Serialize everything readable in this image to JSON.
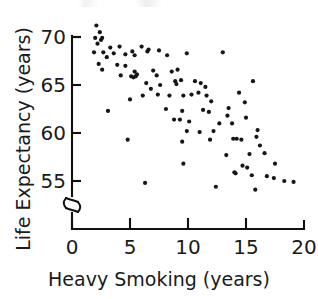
{
  "figure": {
    "background_color": "#ffffff",
    "ink_color": "#161616"
  },
  "axes": {
    "x_title": "Heavy Smoking (years)",
    "y_title": "Life Expectancy (years)",
    "x_ticks": [
      "0",
      "5",
      "10",
      "15",
      "20"
    ],
    "y_ticks": [
      "55",
      "60",
      "65",
      "70"
    ],
    "y_axis_break": "broken-axis-squiggle"
  },
  "chart_data": {
    "type": "scatter",
    "title": "",
    "xlabel": "Heavy Smoking (years)",
    "ylabel": "Life Expectancy (years)",
    "xlim": [
      0,
      20
    ],
    "ylim": [
      53.5,
      71.5
    ],
    "xticks": [
      0,
      5,
      10,
      15,
      20
    ],
    "yticks": [
      55,
      60,
      65,
      70
    ],
    "grid": false,
    "legend": null,
    "y_axis_broken": true,
    "marker": "filled-circle",
    "n_points": 97,
    "points": [
      [
        2.1,
        71.2
      ],
      [
        2.4,
        70.5
      ],
      [
        2.0,
        69.9
      ],
      [
        2.5,
        69.7
      ],
      [
        2.6,
        69.9
      ],
      [
        2.2,
        69.3
      ],
      [
        1.9,
        68.4
      ],
      [
        2.7,
        68.4
      ],
      [
        3.3,
        68.9
      ],
      [
        4.1,
        69.0
      ],
      [
        3.0,
        67.9
      ],
      [
        3.6,
        68.3
      ],
      [
        2.3,
        67.2
      ],
      [
        2.6,
        66.6
      ],
      [
        4.6,
        68.2
      ],
      [
        5.2,
        68.5
      ],
      [
        5.4,
        68.1
      ],
      [
        6.0,
        69.0
      ],
      [
        6.5,
        68.5
      ],
      [
        6.6,
        68.7
      ],
      [
        7.5,
        68.6
      ],
      [
        8.2,
        68.1
      ],
      [
        9.9,
        68.3
      ],
      [
        13.0,
        68.4
      ],
      [
        3.9,
        67.1
      ],
      [
        4.6,
        67.0
      ],
      [
        4.2,
        66.0
      ],
      [
        5.1,
        65.9
      ],
      [
        5.3,
        65.8
      ],
      [
        5.5,
        65.9
      ],
      [
        5.6,
        66.1
      ],
      [
        5.4,
        66.4
      ],
      [
        7.0,
        66.5
      ],
      [
        7.3,
        66.0
      ],
      [
        8.6,
        66.4
      ],
      [
        9.1,
        66.6
      ],
      [
        8.9,
        65.4
      ],
      [
        9.4,
        65.5
      ],
      [
        9.0,
        65.1
      ],
      [
        6.4,
        65.2
      ],
      [
        6.8,
        64.6
      ],
      [
        7.6,
        65.0
      ],
      [
        10.6,
        65.4
      ],
      [
        11.1,
        65.2
      ],
      [
        11.5,
        64.8
      ],
      [
        15.6,
        65.4
      ],
      [
        5.0,
        63.5
      ],
      [
        6.1,
        63.9
      ],
      [
        7.4,
        64.0
      ],
      [
        8.4,
        63.9
      ],
      [
        9.6,
        63.9
      ],
      [
        10.3,
        64.0
      ],
      [
        10.9,
        64.2
      ],
      [
        11.6,
        63.9
      ],
      [
        12.0,
        63.3
      ],
      [
        14.4,
        64.2
      ],
      [
        14.9,
        63.2
      ],
      [
        8.1,
        62.5
      ],
      [
        9.5,
        62.3
      ],
      [
        11.3,
        62.4
      ],
      [
        11.8,
        62.2
      ],
      [
        13.5,
        62.6
      ],
      [
        13.4,
        61.8
      ],
      [
        15.0,
        61.6
      ],
      [
        3.1,
        62.3
      ],
      [
        8.8,
        61.4
      ],
      [
        9.3,
        61.4
      ],
      [
        10.1,
        61.2
      ],
      [
        12.7,
        61.0
      ],
      [
        13.8,
        61.0
      ],
      [
        9.9,
        60.2
      ],
      [
        11.0,
        60.1
      ],
      [
        12.2,
        60.2
      ],
      [
        16.0,
        60.3
      ],
      [
        4.8,
        59.3
      ],
      [
        9.5,
        59.1
      ],
      [
        11.9,
        59.3
      ],
      [
        13.9,
        59.4
      ],
      [
        14.2,
        59.4
      ],
      [
        14.6,
        59.3
      ],
      [
        15.9,
        59.6
      ],
      [
        16.2,
        58.7
      ],
      [
        13.3,
        57.7
      ],
      [
        15.3,
        57.8
      ],
      [
        16.6,
        57.9
      ],
      [
        9.6,
        56.8
      ],
      [
        14.7,
        56.6
      ],
      [
        15.1,
        56.4
      ],
      [
        17.5,
        56.8
      ],
      [
        14.0,
        55.9
      ],
      [
        14.1,
        55.8
      ],
      [
        15.5,
        55.6
      ],
      [
        16.8,
        55.5
      ],
      [
        17.4,
        55.3
      ],
      [
        18.3,
        55.0
      ],
      [
        19.1,
        54.9
      ],
      [
        6.3,
        54.8
      ],
      [
        12.4,
        54.4
      ],
      [
        15.8,
        54.1
      ]
    ]
  }
}
